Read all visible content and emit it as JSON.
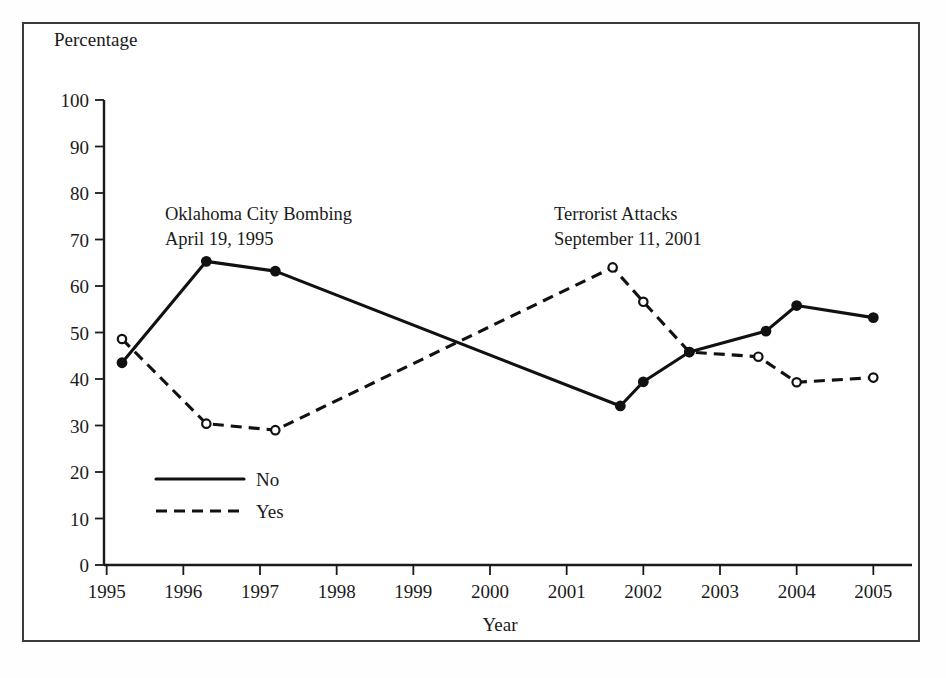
{
  "chart_data": {
    "type": "line",
    "title": "",
    "xlabel": "Year",
    "ylabel": "Percentage",
    "xlim": [
      1994.6,
      2005.4
    ],
    "ylim": [
      0,
      100
    ],
    "grid": false,
    "legend_position": "inside-lower-left",
    "x_ticks": [
      "1995",
      "1996",
      "1997",
      "1998",
      "1999",
      "2000",
      "2001",
      "2002",
      "2003",
      "2004",
      "2005"
    ],
    "x_tick_values": [
      1995,
      1996,
      1997,
      1998,
      1999,
      2000,
      2001,
      2002,
      2003,
      2004,
      2005
    ],
    "y_ticks": [
      "0",
      "10",
      "20",
      "30",
      "40",
      "50",
      "60",
      "70",
      "80",
      "90",
      "100"
    ],
    "y_tick_values": [
      0,
      10,
      20,
      30,
      40,
      50,
      60,
      70,
      80,
      90,
      100
    ],
    "series": [
      {
        "name": "No",
        "style": "solid",
        "marker": "filled-circle",
        "color": "#111111",
        "x": [
          1995.2,
          1996.3,
          1997.2,
          2001.7,
          2002.0,
          2002.6,
          2003.6,
          2004.0,
          2005.0
        ],
        "values": [
          43.5,
          65.3,
          63.2,
          34.2,
          39.4,
          45.8,
          50.3,
          55.8,
          53.2
        ]
      },
      {
        "name": "Yes",
        "style": "dashed",
        "marker": "open-circle",
        "color": "#111111",
        "x": [
          1995.2,
          1996.3,
          1997.2,
          2001.6,
          2002.0,
          2002.6,
          2003.5,
          2004.0,
          2005.0
        ],
        "values": [
          48.6,
          30.4,
          29.0,
          64.0,
          56.6,
          45.8,
          44.8,
          39.3,
          40.3
        ]
      }
    ],
    "annotations": [
      {
        "line1": "Oklahoma City Bombing",
        "line2": "April 19, 1995",
        "x_px": 165,
        "y_px": 218
      },
      {
        "line1": "Terrorist Attacks",
        "line2": "September 11, 2001",
        "x_px": 554,
        "y_px": 218
      }
    ],
    "legend_entries": [
      {
        "label": "No",
        "style": "solid"
      },
      {
        "label": "Yes",
        "style": "dashed"
      }
    ]
  }
}
